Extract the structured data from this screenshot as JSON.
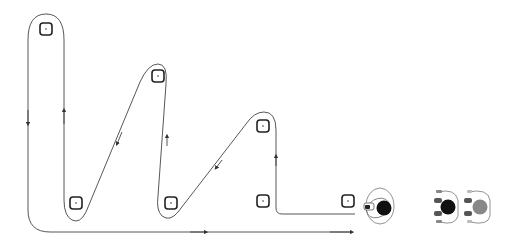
{
  "diagram": {
    "colors": {
      "path": "#444444",
      "marker": "#222222",
      "cart_dark": "#111111",
      "cart_gray": "#888888",
      "outline": "#777777"
    },
    "markers": [
      {
        "id": "loc-1",
        "x": 46,
        "y": 29
      },
      {
        "id": "loc-2",
        "x": 76,
        "y": 203
      },
      {
        "id": "loc-3",
        "x": 158,
        "y": 76
      },
      {
        "id": "loc-4",
        "x": 171,
        "y": 203
      },
      {
        "id": "loc-5",
        "x": 263,
        "y": 126
      },
      {
        "id": "loc-6",
        "x": 263,
        "y": 201
      },
      {
        "id": "loc-7",
        "x": 348,
        "y": 201
      }
    ],
    "agents": [
      {
        "id": "worker-with-cart",
        "x": 380,
        "y": 208,
        "fill": "#111111"
      },
      {
        "id": "cart-dark",
        "x": 445,
        "y": 207,
        "fill": "#111111"
      },
      {
        "id": "cart-gray",
        "x": 478,
        "y": 207,
        "fill": "#888888"
      }
    ]
  }
}
